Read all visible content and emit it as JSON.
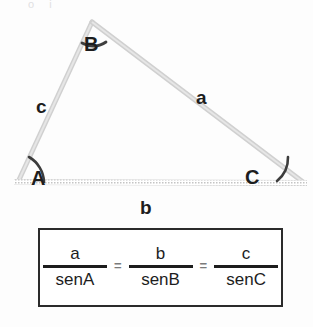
{
  "page": {
    "background_color": "#fdfdfd",
    "scan_remnant_text": "o          i"
  },
  "figure": {
    "name": "labelled-triangle",
    "stroke_color": "#cfcfcf",
    "baseline_color": "#d2d2d2",
    "arc_color": "#4a4a4a",
    "vertices": [
      {
        "id": "A",
        "label": "A",
        "x": 18,
        "y": 182
      },
      {
        "id": "B",
        "label": "B",
        "x": 92,
        "y": 22
      },
      {
        "id": "C",
        "label": "C",
        "x": 303,
        "y": 182
      }
    ],
    "sides": [
      {
        "id": "a",
        "label": "a",
        "between": "B-C"
      },
      {
        "id": "b",
        "label": "b",
        "between": "A-C"
      },
      {
        "id": "c",
        "label": "c",
        "between": "A-B"
      }
    ],
    "angle_marks": [
      {
        "at": "A",
        "style": "arc"
      },
      {
        "at": "B",
        "style": "arc"
      },
      {
        "at": "C",
        "style": "arc"
      }
    ]
  },
  "formula": {
    "name": "law-of-sines",
    "border_color": "#2b2b2b",
    "terms": [
      {
        "numerator": "a",
        "denominator": "senA"
      },
      {
        "numerator": "b",
        "denominator": "senB"
      },
      {
        "numerator": "c",
        "denominator": "senC"
      }
    ],
    "operators": [
      "=",
      "="
    ]
  }
}
